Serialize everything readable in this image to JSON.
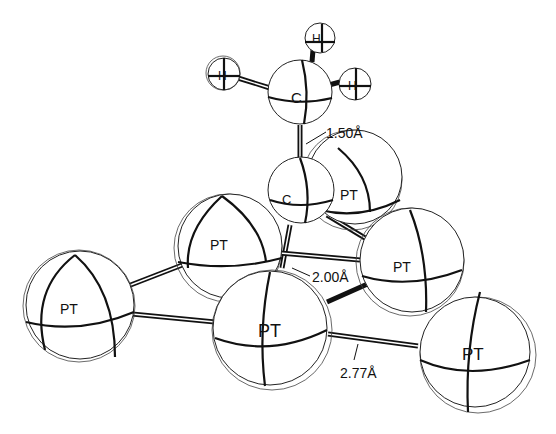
{
  "diagram": {
    "type": "molecular-structure",
    "atoms": {
      "h1": {
        "label": "H"
      },
      "h2": {
        "label": "H"
      },
      "h3": {
        "label": "H"
      },
      "c_methyl": {
        "label": "C"
      },
      "c_bound": {
        "label": "C"
      },
      "pt_back": {
        "label": "PT"
      },
      "pt_left_mid": {
        "label": "PT"
      },
      "pt_right_mid": {
        "label": "PT"
      },
      "pt_far_left": {
        "label": "PT"
      },
      "pt_front": {
        "label": "PT"
      },
      "pt_far_right": {
        "label": "PT"
      }
    },
    "measurements": {
      "c_c_bond": "1.50Å",
      "c_pt_bond": "2.00Å",
      "pt_pt_bond": "2.77Å"
    }
  }
}
